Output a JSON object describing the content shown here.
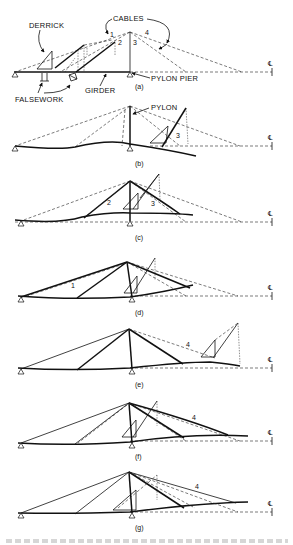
{
  "figure": {
    "labels": {
      "derrick": "DERRICK",
      "cables": "CABLES",
      "pylon_pier": "PYLON PIER",
      "girder": "GIRDER",
      "falsework": "FALSEWORK",
      "pylon": "PYLON",
      "centerline": "℄"
    },
    "cable_numbers": {
      "a": [
        "1",
        "2",
        "3",
        "4"
      ],
      "b": [
        "3"
      ],
      "c": [
        "2",
        "3"
      ],
      "d": [
        "1"
      ],
      "e": [
        "4"
      ],
      "f": [
        "4"
      ],
      "g": [
        "4"
      ]
    },
    "panels": [
      {
        "id": "a",
        "label": "(a)",
        "stage": "Side span on falsework, derrick erecting cables"
      },
      {
        "id": "b",
        "label": "(b)",
        "stage": "Cantilevering toward centerline, cable 3"
      },
      {
        "id": "c",
        "label": "(c)",
        "stage": "Cables 2 and 3 installed"
      },
      {
        "id": "d",
        "label": "(d)",
        "stage": "Cable 1 installed"
      },
      {
        "id": "e",
        "label": "(e)",
        "stage": "Derrick advancing, cable 4"
      },
      {
        "id": "f",
        "label": "(f)",
        "stage": "Cable 4 installed"
      },
      {
        "id": "g",
        "label": "(g)",
        "stage": "Final stage, cable 4"
      }
    ]
  }
}
